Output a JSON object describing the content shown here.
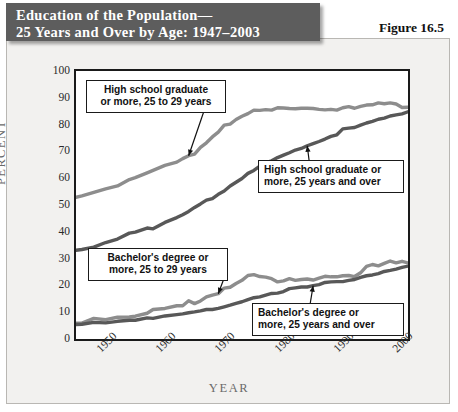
{
  "banner": {
    "line1": "Education of the Population—",
    "line2": "25 Years and Over by Age: 1947–2003"
  },
  "figure_label": "Figure 16.5",
  "colors": {
    "banner_bg": "#5d5d5d",
    "paper_bg": "#f2f1ef",
    "frame_border": "#1a1a1a",
    "series_light": "#8d8d8d",
    "series_dark": "#585858",
    "axis_text": "#2a2a2a",
    "axis_title": "#6a6a6a"
  },
  "callouts": [
    {
      "id": "hs-25-29",
      "line1": "High school graduate",
      "line2": "or more, 25 to 29 years"
    },
    {
      "id": "hs-25-over",
      "line1": "High school graduate or",
      "line2": "more, 25 years and over"
    },
    {
      "id": "ba-25-29",
      "line1": "Bachelor's degree or",
      "line2": "more, 25 to 29 years"
    },
    {
      "id": "ba-25-over",
      "line1": "Bachelor's degree or",
      "line2": "more, 25 years and over"
    }
  ],
  "chart_data": {
    "type": "line",
    "xlabel": "YEAR",
    "ylabel": "PERCENT",
    "xlim": [
      1947,
      2003
    ],
    "ylim": [
      0,
      100
    ],
    "yticks": [
      0,
      10,
      20,
      30,
      40,
      50,
      60,
      70,
      80,
      90,
      100
    ],
    "xticks": [
      1950,
      1960,
      1970,
      1980,
      1990,
      2000
    ],
    "grid": false,
    "legend_position": "annotations-on-plot",
    "series": [
      {
        "name": "High school graduate or more, 25 to 29 years",
        "color": "#8d8d8d",
        "x": [
          1947,
          1948,
          1950,
          1952,
          1954,
          1956,
          1957,
          1959,
          1960,
          1962,
          1964,
          1965,
          1966,
          1967,
          1968,
          1969,
          1970,
          1971,
          1972,
          1973,
          1974,
          1975,
          1976,
          1977,
          1978,
          1979,
          1980,
          1981,
          1982,
          1983,
          1984,
          1985,
          1986,
          1987,
          1988,
          1989,
          1990,
          1991,
          1992,
          1993,
          1994,
          1995,
          1996,
          1997,
          1998,
          1999,
          2000,
          2001,
          2002,
          2003
        ],
        "values": [
          52.9,
          53.4,
          54.7,
          56.0,
          57.1,
          59.5,
          60.2,
          62.0,
          62.9,
          64.8,
          66.0,
          67.3,
          68.4,
          69.0,
          71.5,
          73.2,
          75.4,
          77.2,
          79.8,
          80.2,
          81.9,
          83.1,
          84.1,
          85.4,
          85.3,
          85.6,
          85.4,
          86.3,
          86.2,
          86.0,
          85.9,
          86.1,
          86.1,
          86.0,
          85.7,
          85.5,
          85.7,
          85.4,
          86.3,
          86.7,
          86.1,
          86.8,
          87.3,
          87.4,
          88.1,
          87.8,
          88.1,
          87.7,
          86.4,
          86.5
        ]
      },
      {
        "name": "High school graduate or more, 25 years and over",
        "color": "#585858",
        "x": [
          1947,
          1948,
          1950,
          1952,
          1954,
          1956,
          1957,
          1959,
          1960,
          1962,
          1964,
          1965,
          1966,
          1967,
          1968,
          1969,
          1970,
          1971,
          1972,
          1973,
          1974,
          1975,
          1976,
          1977,
          1978,
          1979,
          1980,
          1981,
          1982,
          1983,
          1984,
          1985,
          1986,
          1987,
          1988,
          1989,
          1990,
          1991,
          1992,
          1993,
          1994,
          1995,
          1996,
          1997,
          1998,
          1999,
          2000,
          2001,
          2002,
          2003
        ],
        "values": [
          33.1,
          33.4,
          34.3,
          36.0,
          37.3,
          39.5,
          39.9,
          41.4,
          41.1,
          43.5,
          45.3,
          46.4,
          47.6,
          49.1,
          50.4,
          51.8,
          52.4,
          54.0,
          55.2,
          57.1,
          58.5,
          59.9,
          61.8,
          62.9,
          64.5,
          65.8,
          66.5,
          67.7,
          68.6,
          69.5,
          70.5,
          71.1,
          72.1,
          72.9,
          73.7,
          74.6,
          75.6,
          76.2,
          78.4,
          78.7,
          78.9,
          79.8,
          80.6,
          81.2,
          82.0,
          82.4,
          83.2,
          83.6,
          84.0,
          84.8
        ]
      },
      {
        "name": "Bachelor's degree or more, 25 to 29 years",
        "color": "#8d8d8d",
        "x": [
          1947,
          1948,
          1950,
          1952,
          1954,
          1956,
          1957,
          1959,
          1960,
          1962,
          1964,
          1965,
          1966,
          1967,
          1968,
          1969,
          1970,
          1971,
          1972,
          1973,
          1974,
          1975,
          1976,
          1977,
          1978,
          1979,
          1980,
          1981,
          1982,
          1983,
          1984,
          1985,
          1986,
          1987,
          1988,
          1989,
          1990,
          1991,
          1992,
          1993,
          1994,
          1995,
          1996,
          1997,
          1998,
          1999,
          2000,
          2001,
          2002,
          2003
        ],
        "values": [
          5.9,
          5.9,
          7.7,
          7.2,
          8.1,
          8.2,
          8.5,
          9.6,
          11.0,
          11.4,
          12.4,
          12.4,
          14.3,
          13.2,
          14.2,
          15.7,
          16.4,
          16.9,
          19.0,
          19.3,
          20.7,
          21.9,
          23.7,
          24.0,
          23.3,
          23.1,
          22.5,
          21.3,
          21.7,
          22.5,
          21.9,
          22.2,
          22.4,
          22.0,
          22.7,
          23.4,
          23.2,
          23.2,
          23.6,
          23.7,
          23.3,
          24.7,
          27.1,
          27.8,
          27.3,
          28.2,
          29.1,
          28.4,
          29.0,
          28.4
        ]
      },
      {
        "name": "Bachelor's degree or more, 25 years and over",
        "color": "#585858",
        "x": [
          1947,
          1948,
          1950,
          1952,
          1954,
          1956,
          1957,
          1959,
          1960,
          1962,
          1964,
          1965,
          1966,
          1967,
          1968,
          1969,
          1970,
          1971,
          1972,
          1973,
          1974,
          1975,
          1976,
          1977,
          1978,
          1979,
          1980,
          1981,
          1982,
          1983,
          1984,
          1985,
          1986,
          1987,
          1988,
          1989,
          1990,
          1991,
          1992,
          1993,
          1994,
          1995,
          1996,
          1997,
          1998,
          1999,
          2000,
          2001,
          2002,
          2003
        ],
        "values": [
          5.4,
          5.5,
          6.2,
          6.0,
          6.6,
          7.0,
          7.0,
          7.9,
          7.7,
          8.6,
          9.1,
          9.4,
          9.8,
          10.1,
          10.5,
          11.0,
          11.0,
          11.4,
          12.0,
          12.6,
          13.3,
          13.9,
          14.7,
          15.4,
          15.7,
          16.4,
          17.0,
          17.1,
          17.7,
          18.8,
          19.1,
          19.4,
          19.4,
          19.9,
          20.3,
          21.1,
          21.3,
          21.4,
          21.4,
          21.9,
          22.2,
          23.0,
          23.6,
          23.9,
          24.4,
          25.2,
          25.6,
          26.1,
          26.7,
          27.2
        ]
      }
    ],
    "annotations": [
      {
        "text": "High school graduate or more, 25 to 29 years",
        "points_to_year": 1966,
        "points_to_value": 68
      },
      {
        "text": "High school graduate or more, 25 years and over",
        "points_to_year": 1986,
        "points_to_value": 72
      },
      {
        "text": "Bachelor's degree or more, 25 to 29 years",
        "points_to_year": 1971,
        "points_to_value": 17
      },
      {
        "text": "Bachelor's degree or more, 25 years and over",
        "points_to_year": 1987,
        "points_to_value": 20
      }
    ]
  }
}
